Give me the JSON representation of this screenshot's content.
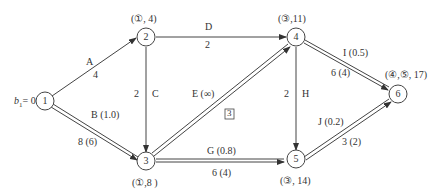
{
  "diagram": {
    "nodes": [
      {
        "id": "1",
        "label": "1",
        "annotation": "b1 = 0"
      },
      {
        "id": "2",
        "label": "2",
        "annotation": "(①, 4)"
      },
      {
        "id": "3",
        "label": "3",
        "annotation": "(①,8 )"
      },
      {
        "id": "4",
        "label": "4",
        "annotation": "(③,11)"
      },
      {
        "id": "5",
        "label": "5",
        "annotation": "(③, 14)"
      },
      {
        "id": "6",
        "label": "6",
        "annotation": "(④,⑤, 17)"
      }
    ],
    "edges": [
      {
        "from": "1",
        "to": "2",
        "name": "A",
        "value": "4",
        "double": false
      },
      {
        "from": "1",
        "to": "3",
        "name": "B (1.0)",
        "value": "8 (6)",
        "double": true
      },
      {
        "from": "2",
        "to": "3",
        "name": "C",
        "value": "2",
        "double": false
      },
      {
        "from": "2",
        "to": "4",
        "name": "D",
        "value": "2",
        "double": false
      },
      {
        "from": "3",
        "to": "4",
        "name": "E (∞)",
        "value": "3",
        "double": true
      },
      {
        "from": "3",
        "to": "5",
        "name": "G (0.8)",
        "value": "6 (4)",
        "double": true
      },
      {
        "from": "4",
        "to": "5",
        "name": "H",
        "value": "2",
        "double": false
      },
      {
        "from": "4",
        "to": "6",
        "name": "I (0.5)",
        "value": "6 (4)",
        "double": true
      },
      {
        "from": "5",
        "to": "6",
        "name": "J (0.2)",
        "value": "3 (2)",
        "double": true
      }
    ],
    "b1_label": "b",
    "b1_sub": "1",
    "b1_value": "= 0"
  }
}
